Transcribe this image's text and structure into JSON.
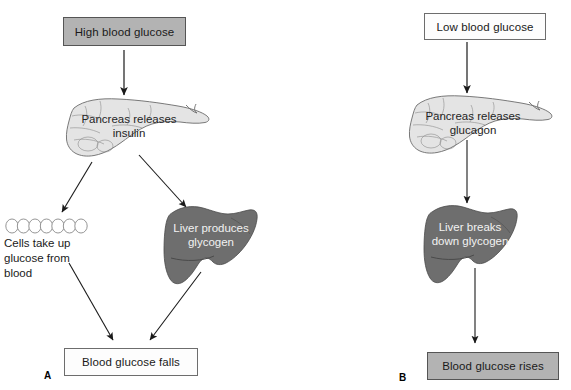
{
  "diagram": {
    "colors": {
      "box_fill_gray": "#b3b3b3",
      "box_fill_white": "#fdfdfd",
      "box_border": "#6d6d6d",
      "pancreas_fill": "#e4e4e4",
      "pancreas_stroke": "#6b6b6b",
      "liver_fill": "#6e6e6e",
      "liver_stroke": "#4a4a4a",
      "cell_fill": "#ffffff",
      "cell_stroke": "#8a8a8a",
      "arrow": "#1a1a1a",
      "background": "#ffffff"
    }
  },
  "panel_a": {
    "letter": "A",
    "start_box": {
      "label": "High blood glucose",
      "fill": "gray"
    },
    "pancreas": {
      "line1": "Pancreas releases",
      "line2": "insulin",
      "icon": "pancreas-icon"
    },
    "cells": {
      "icon": "cells-row-icon",
      "count": 8,
      "caption_line1": "Cells take up",
      "caption_line2": "glucose from",
      "caption_line3": "blood"
    },
    "liver": {
      "line1": "Liver produces",
      "line2": "glycogen",
      "icon": "liver-icon"
    },
    "end_box": {
      "label": "Blood glucose falls",
      "fill": "white"
    }
  },
  "panel_b": {
    "letter": "B",
    "start_box": {
      "label": "Low blood glucose",
      "fill": "white"
    },
    "pancreas": {
      "line1": "Pancreas releases",
      "line2": "glucagon",
      "icon": "pancreas-icon"
    },
    "liver": {
      "line1": "Liver breaks",
      "line2": "down glycogen",
      "icon": "liver-icon"
    },
    "end_box": {
      "label": "Blood glucose rises",
      "fill": "gray"
    }
  }
}
